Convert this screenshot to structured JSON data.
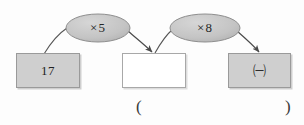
{
  "diagram": {
    "type": "function-machine-flow",
    "title": "",
    "background_color": "#fdfdfd",
    "box_fill_color": "#cfcfcf",
    "box_border_color": "#9a9a9a",
    "ellipse_fill_color": "#c4c4c4",
    "ellipse_border_color": "#8f8f8f",
    "arrow_color": "#4a4a4a",
    "nodes": [
      {
        "id": "box-start",
        "kind": "box",
        "fill": "gray",
        "value": "17"
      },
      {
        "id": "box-middle",
        "kind": "box",
        "fill": "white",
        "value": ""
      },
      {
        "id": "box-end",
        "kind": "box",
        "fill": "gray",
        "value": "㈠"
      }
    ],
    "operators": [
      {
        "id": "op-1",
        "kind": "ellipse",
        "label": "×5"
      },
      {
        "id": "op-2",
        "kind": "ellipse",
        "label": "×8"
      }
    ],
    "answer_field": {
      "open_paren": "(",
      "close_paren": ")",
      "value": ""
    }
  }
}
